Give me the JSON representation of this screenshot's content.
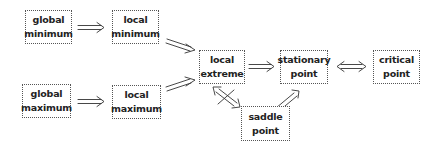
{
  "diagram": {
    "nodes": [
      {
        "id": "global-minimum",
        "lines": [
          "global",
          "minimum"
        ]
      },
      {
        "id": "local-minimum",
        "lines": [
          "local",
          "minimum"
        ]
      },
      {
        "id": "global-maximum",
        "lines": [
          "global",
          "maximum"
        ]
      },
      {
        "id": "local-maximum",
        "lines": [
          "local",
          "maximum"
        ]
      },
      {
        "id": "local-extreme",
        "lines": [
          "local",
          "extreme"
        ]
      },
      {
        "id": "stationary-point",
        "lines": [
          "stationary",
          "point"
        ]
      },
      {
        "id": "critical-point",
        "lines": [
          "critical",
          "point"
        ]
      },
      {
        "id": "saddle-point",
        "lines": [
          "saddle",
          "point"
        ]
      }
    ],
    "edges": [
      {
        "from": "global-minimum",
        "to": "local-minimum",
        "type": "implies"
      },
      {
        "from": "global-maximum",
        "to": "local-maximum",
        "type": "implies"
      },
      {
        "from": "local-minimum",
        "to": "local-extreme",
        "type": "implies"
      },
      {
        "from": "local-maximum",
        "to": "local-extreme",
        "type": "implies"
      },
      {
        "from": "local-extreme",
        "to": "stationary-point",
        "type": "implies"
      },
      {
        "from": "stationary-point",
        "to": "critical-point",
        "type": "equivalent"
      },
      {
        "from": "saddle-point",
        "to": "stationary-point",
        "type": "implies"
      },
      {
        "from": "local-extreme",
        "to": "saddle-point",
        "type": "not-equivalent"
      }
    ],
    "colors": {
      "border": "#555555",
      "text": "#222222",
      "arrow": "#333333"
    }
  }
}
